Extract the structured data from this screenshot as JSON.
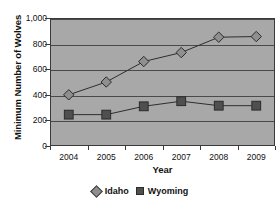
{
  "chart_data": {
    "type": "line",
    "title": "",
    "xlabel": "Year",
    "ylabel": "Minimum Number of Wolves",
    "categories": [
      "2004",
      "2005",
      "2006",
      "2007",
      "2008",
      "2009"
    ],
    "ylim": [
      0,
      1000
    ],
    "yticks": [
      0,
      200,
      400,
      600,
      800,
      1000
    ],
    "ytick_labels": [
      "0",
      "200",
      "400",
      "600",
      "800",
      "1,000"
    ],
    "grid": true,
    "legend_position": "bottom",
    "series": [
      {
        "name": "Idaho",
        "marker": "diamond",
        "color": "#8f8f8f",
        "values": [
          400,
          500,
          660,
          730,
          850,
          855
        ]
      },
      {
        "name": "Wyoming",
        "marker": "square",
        "color": "#4f4f4f",
        "values": [
          245,
          245,
          310,
          350,
          315,
          315
        ]
      }
    ]
  },
  "legend": {
    "items": [
      {
        "label": "Idaho"
      },
      {
        "label": "Wyoming"
      }
    ]
  }
}
